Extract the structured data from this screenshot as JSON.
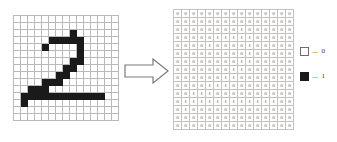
{
  "figure": {
    "title": ""
  },
  "arrow": {
    "name": "right-block-arrow",
    "direction": "right",
    "color": "#7a7a7a"
  },
  "legend": {
    "items": [
      {
        "swatch": "empty-square",
        "dots": "⋯",
        "value": "0"
      },
      {
        "swatch": "filled-square",
        "dots": "⋯",
        "value": "1"
      }
    ]
  },
  "colors": {
    "ink": "#1a1a1a",
    "grid_line": "#b9b9b9",
    "grid_border": "#8a8a8a",
    "digit_text": "#555555",
    "background": "#ffffff"
  },
  "chart_data": {
    "type": "heatmap",
    "title": "",
    "subtitle": "",
    "xlabel": "",
    "ylabel": "",
    "rows": 15,
    "cols": 15,
    "value_labels": {
      "0": "0",
      "1": "1"
    },
    "legend_position": "right",
    "grid": true,
    "depicted_digit": "2",
    "matrix": [
      [
        0,
        0,
        0,
        0,
        0,
        0,
        0,
        0,
        0,
        0,
        0,
        0,
        0,
        0,
        0
      ],
      [
        0,
        0,
        0,
        0,
        0,
        0,
        0,
        0,
        0,
        0,
        0,
        0,
        0,
        0,
        0
      ],
      [
        0,
        0,
        0,
        0,
        0,
        0,
        0,
        0,
        1,
        0,
        0,
        0,
        0,
        0,
        0
      ],
      [
        0,
        0,
        0,
        0,
        0,
        1,
        1,
        1,
        1,
        1,
        0,
        0,
        0,
        0,
        0
      ],
      [
        0,
        0,
        0,
        0,
        1,
        0,
        0,
        0,
        0,
        1,
        0,
        0,
        0,
        0,
        0
      ],
      [
        0,
        0,
        0,
        0,
        0,
        0,
        0,
        0,
        0,
        1,
        0,
        0,
        0,
        0,
        0
      ],
      [
        0,
        0,
        0,
        0,
        0,
        0,
        0,
        0,
        1,
        1,
        0,
        0,
        0,
        0,
        0
      ],
      [
        0,
        0,
        0,
        0,
        0,
        0,
        0,
        1,
        1,
        0,
        0,
        0,
        0,
        0,
        0
      ],
      [
        0,
        0,
        0,
        0,
        0,
        0,
        1,
        1,
        0,
        0,
        0,
        0,
        0,
        0,
        0
      ],
      [
        0,
        0,
        0,
        0,
        1,
        1,
        1,
        0,
        0,
        0,
        0,
        0,
        0,
        0,
        0
      ],
      [
        0,
        0,
        1,
        1,
        1,
        0,
        0,
        0,
        0,
        0,
        0,
        0,
        0,
        0,
        0
      ],
      [
        0,
        1,
        1,
        1,
        1,
        1,
        1,
        1,
        1,
        1,
        1,
        1,
        1,
        0,
        0
      ],
      [
        0,
        1,
        0,
        0,
        0,
        0,
        0,
        0,
        0,
        0,
        0,
        0,
        0,
        0,
        0
      ],
      [
        0,
        0,
        0,
        0,
        0,
        0,
        0,
        0,
        0,
        0,
        0,
        0,
        0,
        0,
        0
      ],
      [
        0,
        0,
        0,
        0,
        0,
        0,
        0,
        0,
        0,
        0,
        0,
        0,
        0,
        0,
        0
      ]
    ]
  }
}
